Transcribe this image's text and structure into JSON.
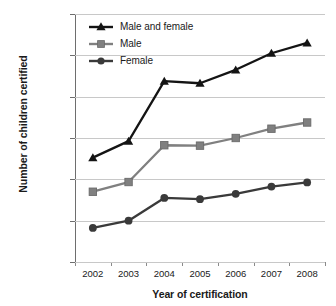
{
  "chart_data": {
    "type": "line",
    "title": "",
    "xlabel": "Year of certification",
    "ylabel": "Number of children certified",
    "categories": [
      "2002",
      "2003",
      "2004",
      "2005",
      "2006",
      "2007",
      "2008"
    ],
    "x": [
      2002,
      2003,
      2004,
      2005,
      2006,
      2007,
      2008
    ],
    "ylim": [
      0,
      120000
    ],
    "yticks": [
      0,
      20000,
      40000,
      60000,
      80000,
      100000,
      120000
    ],
    "ytick_labels": [
      "0",
      "20 000",
      "40 000",
      "60 000",
      "80 000",
      "100 000",
      "120 000"
    ],
    "grid": true,
    "legend_position": "top-left",
    "series": [
      {
        "name": "Male and female",
        "marker": "triangle",
        "color": "#141414",
        "values": [
          50500,
          58500,
          87500,
          86500,
          93000,
          101000,
          106000
        ]
      },
      {
        "name": "Male",
        "marker": "square",
        "color": "#808080",
        "values": [
          34000,
          38700,
          56500,
          56300,
          60000,
          64500,
          67500
        ]
      },
      {
        "name": "Female",
        "marker": "circle",
        "color": "#3a3a3a",
        "values": [
          16500,
          20000,
          31000,
          30400,
          33000,
          36500,
          38500
        ]
      }
    ]
  },
  "legend": {
    "items": [
      {
        "label": "Male and female"
      },
      {
        "label": "Male"
      },
      {
        "label": "Female"
      }
    ]
  }
}
